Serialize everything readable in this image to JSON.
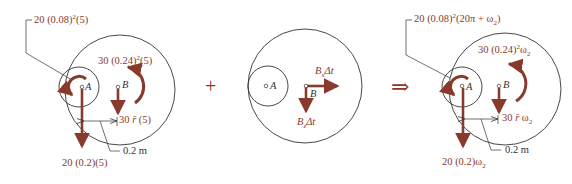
{
  "colors": {
    "vector": "#8a3a2c",
    "line": "#333333",
    "background": "#ffffff"
  },
  "operators": {
    "plus": "+",
    "implies": "⇒"
  },
  "diagram_left": {
    "point_a": "A",
    "point_b": "B",
    "moment_a": {
      "base": "20 (0.08)",
      "exp": "2",
      "tail": "(5)"
    },
    "moment_b": {
      "base": "30 (0.24)",
      "exp": "2",
      "tail": "(5)"
    },
    "force_b": {
      "coef": "30 ",
      "var": "r̄",
      "tail": " (5)"
    },
    "force_a": "20 (0.2)(5)",
    "dimension": "0.2 m"
  },
  "diagram_middle": {
    "point_a": "A",
    "point_b": "B",
    "impulse_x": {
      "var": "B",
      "sub": "x",
      "tail": "Δt"
    },
    "impulse_y": {
      "var": "B",
      "sub": "z",
      "tail": "Δt"
    }
  },
  "diagram_right": {
    "point_a": "A",
    "point_b": "B",
    "moment_a": {
      "base": "20 (0.08)",
      "exp": "2",
      "tail": "(20π + ω",
      "sub": "2",
      "close": ")"
    },
    "moment_b": {
      "base": "30 (0.24)",
      "exp": "2",
      "var": "ω",
      "sub": "2"
    },
    "force_b": {
      "coef": "30 ",
      "var": "r̄",
      "tail": " ω",
      "sub": "2"
    },
    "force_a": {
      "base": "20 (0.2)ω",
      "sub": "2"
    },
    "dimension": "0.2 m"
  }
}
